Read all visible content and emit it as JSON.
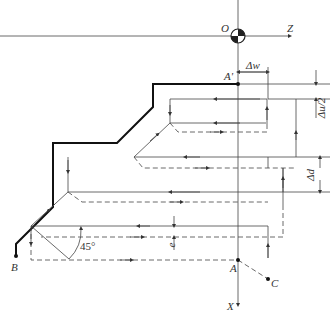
{
  "labels": {
    "origin": "O",
    "z_axis": "Z",
    "x_axis": "X",
    "a_prime": "A'",
    "a": "A",
    "b": "B",
    "c": "C",
    "delta_w": "Δw",
    "delta_u_half": "Δu/2",
    "delta_d": "Δd",
    "e": "e",
    "angle": "45°"
  },
  "colors": {
    "line": "#333333",
    "profile": "#111111"
  }
}
